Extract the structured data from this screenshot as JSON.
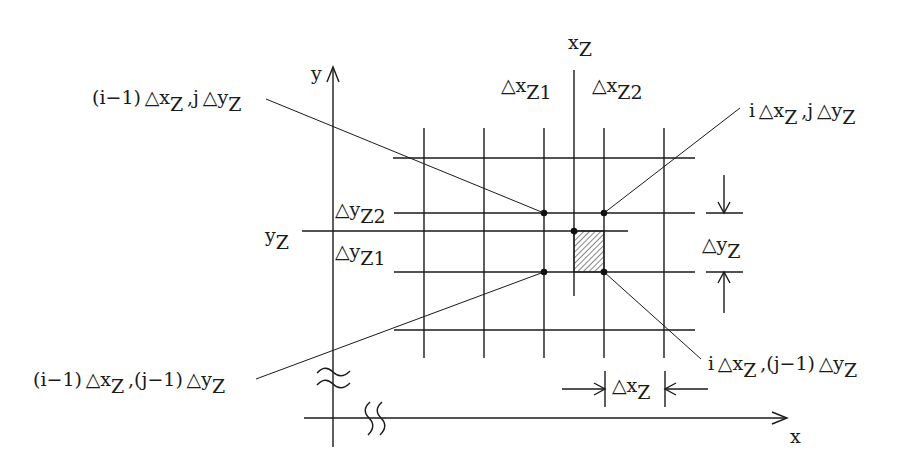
{
  "diagram": {
    "type": "finite-difference grid around staggered point (x_Z, y_Z)",
    "axes": {
      "x_label": "x",
      "y_label": "y",
      "x_break": true,
      "y_break": true
    },
    "reference_lines": {
      "x_z": {
        "base": "x",
        "sub": "Z"
      },
      "y_z": {
        "base": "y",
        "sub": "Z"
      }
    },
    "offsets": {
      "dx_z1": {
        "base": "△x",
        "sub": "Z1"
      },
      "dx_z2": {
        "base": "△x",
        "sub": "Z2"
      },
      "dy_z1": {
        "base": "△y",
        "sub": "Z1"
      },
      "dy_z2": {
        "base": "△y",
        "sub": "Z2"
      }
    },
    "dimensions": {
      "dx_z": {
        "base": "△x",
        "sub": "Z"
      },
      "dy_z": {
        "base": "△y",
        "sub": "Z"
      }
    },
    "node_labels": {
      "top_left": {
        "parts": [
          {
            "t": "(i−1) △x"
          },
          {
            "s": "Z"
          },
          {
            "t": " ,j △y"
          },
          {
            "s": "Z"
          }
        ]
      },
      "top_right": {
        "parts": [
          {
            "t": "i △x"
          },
          {
            "s": "Z"
          },
          {
            "t": " ,j △y"
          },
          {
            "s": "Z"
          }
        ]
      },
      "bottom_left": {
        "parts": [
          {
            "t": "(i−1) △x"
          },
          {
            "s": "Z"
          },
          {
            "t": " ,(j−1) △y"
          },
          {
            "s": "Z"
          }
        ]
      },
      "bottom_right": {
        "parts": [
          {
            "t": "i △x"
          },
          {
            "s": "Z"
          },
          {
            "t": " ,(j−1) △y"
          },
          {
            "s": "Z"
          }
        ]
      }
    },
    "grid": {
      "columns": 5,
      "rows": 4
    },
    "highlighted_cell": "hatched cell between (x_Z, y_Z) and (iΔx_Z, (j−1)Δy_Z)"
  }
}
